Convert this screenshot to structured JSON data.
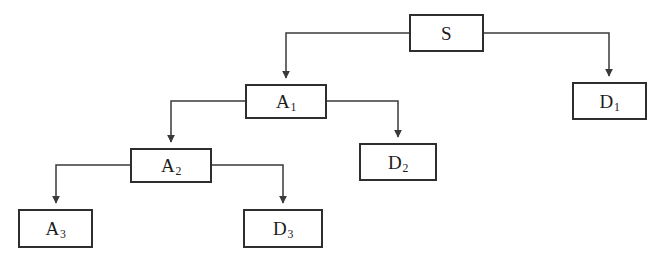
{
  "diagram": {
    "type": "tree-flow-diagram",
    "canvas": {
      "width": 659,
      "height": 266,
      "background": "#ffffff"
    },
    "style": {
      "node_border_color": "#2e2e2e",
      "node_fill": "#ffffff",
      "connector_color": "#3a3a3a",
      "label_color": "#1c1c1c"
    },
    "nodes": [
      {
        "id": "S",
        "base": "S",
        "sub": "",
        "x": 409,
        "y": 14,
        "width": 75,
        "height": 38
      },
      {
        "id": "D1",
        "base": "D",
        "sub": "1",
        "x": 572,
        "y": 82,
        "width": 75,
        "height": 38
      },
      {
        "id": "A1",
        "base": "A",
        "sub": "1",
        "x": 245,
        "y": 84,
        "width": 82,
        "height": 35
      },
      {
        "id": "D2",
        "base": "D",
        "sub": "2",
        "x": 359,
        "y": 143,
        "width": 78,
        "height": 38
      },
      {
        "id": "A2",
        "base": "A",
        "sub": "2",
        "x": 130,
        "y": 148,
        "width": 82,
        "height": 35
      },
      {
        "id": "A3",
        "base": "A",
        "sub": "3",
        "x": 18,
        "y": 209,
        "width": 75,
        "height": 39
      },
      {
        "id": "D3",
        "base": "D",
        "sub": "3",
        "x": 243,
        "y": 209,
        "width": 80,
        "height": 39
      }
    ],
    "edges": [
      {
        "id": "edge-s-a1",
        "from": "S",
        "to": "A1",
        "label": ""
      },
      {
        "id": "edge-s-d1",
        "from": "S",
        "to": "D1",
        "label": ""
      },
      {
        "id": "edge-a1-a2",
        "from": "A1",
        "to": "A2",
        "label": ""
      },
      {
        "id": "edge-a1-d2",
        "from": "A1",
        "to": "D2",
        "label": ""
      },
      {
        "id": "edge-a2-a3",
        "from": "A2",
        "to": "A3",
        "label": ""
      },
      {
        "id": "edge-a2-d3",
        "from": "A2",
        "to": "D3",
        "label": ""
      }
    ]
  }
}
